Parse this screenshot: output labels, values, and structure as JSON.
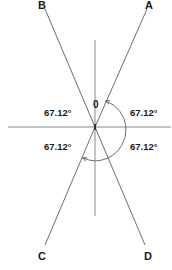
{
  "diagram": {
    "type": "angle-diagram",
    "colors": {
      "line": "#6e6e6e",
      "axis": "#8a8a8a",
      "text": "#1a1a1a",
      "background": "#ffffff"
    },
    "points": {
      "A": "A",
      "B": "B",
      "C": "C",
      "D": "D"
    },
    "center_label": "0",
    "angles": {
      "top_left": "67.12°",
      "top_right": "67.12°",
      "bottom_left": "67.12°",
      "bottom_right": "67.12°"
    }
  }
}
